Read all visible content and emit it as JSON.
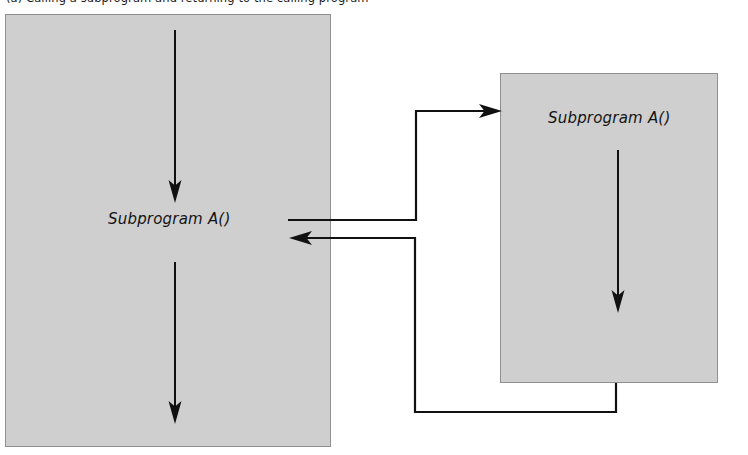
{
  "figure": {
    "caption": "(a) Calling a subprogram and returning to the calling program",
    "background_color": "#ffffff",
    "box_fill_color": "#cfcfcf",
    "box_border_color": "#8f8f8f",
    "line_color": "#111111"
  },
  "diagram": {
    "type": "flow",
    "caller": {
      "name": "caller-program-box",
      "label": "Subprogram A()",
      "flow_arrows": [
        {
          "name": "caller-flow-arrow-before-call",
          "direction": "down"
        },
        {
          "name": "caller-flow-arrow-after-return",
          "direction": "down"
        }
      ]
    },
    "callee": {
      "name": "subprogram-box",
      "label": "Subprogram A()",
      "flow_arrows": [
        {
          "name": "subprogram-flow-arrow",
          "direction": "down"
        }
      ]
    },
    "connectors": [
      {
        "name": "call-connector",
        "from": "caller-program-box",
        "to": "subprogram-box",
        "direction": "right",
        "arrowhead": "into-subprogram-left-edge"
      },
      {
        "name": "return-connector",
        "from": "subprogram-box",
        "to": "caller-program-box",
        "direction": "left",
        "arrowhead": "into-caller-program"
      }
    ]
  }
}
